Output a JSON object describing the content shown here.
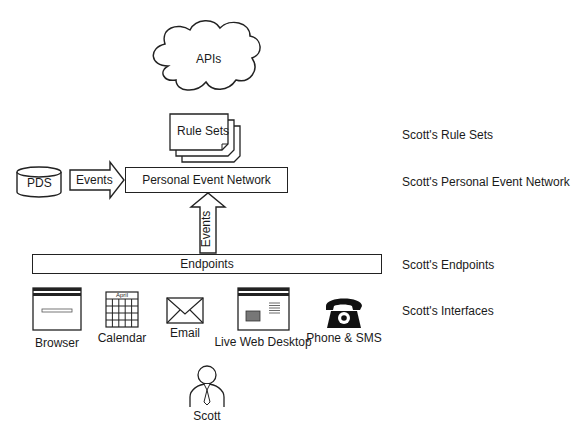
{
  "diagram": {
    "cloud": {
      "label": "APIs"
    },
    "rule_sets": {
      "label": "Rule Sets"
    },
    "pds": {
      "label": "PDS"
    },
    "events_horizontal": {
      "label": "Events"
    },
    "personal_event_network": {
      "label": "Personal Event Network"
    },
    "events_vertical": {
      "label": "Events"
    },
    "endpoints": {
      "label": "Endpoints"
    },
    "interfaces": [
      {
        "name": "browser",
        "label": "Browser"
      },
      {
        "name": "calendar",
        "label": "Calendar",
        "month": "April"
      },
      {
        "name": "email",
        "label": "Email"
      },
      {
        "name": "live-web-desktop",
        "label": "Live Web Desktop"
      },
      {
        "name": "phone-sms",
        "label": "Phone & SMS"
      }
    ],
    "user": {
      "label": "Scott"
    }
  },
  "annotations": {
    "rule_sets": "Scott's Rule Sets",
    "personal_event_network": "Scott's Personal Event Network",
    "endpoints": "Scott's Endpoints",
    "interfaces": "Scott's Interfaces"
  }
}
